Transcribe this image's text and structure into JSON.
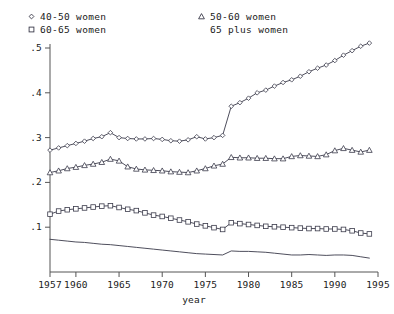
{
  "chart_data": {
    "type": "line",
    "title": "",
    "xlabel": "year",
    "ylabel": "",
    "xlim": [
      1957,
      1995
    ],
    "ylim": [
      0,
      0.53
    ],
    "grid": false,
    "legend_position": "top",
    "xticks": [
      1957,
      1960,
      1965,
      1970,
      1975,
      1980,
      1985,
      1990,
      1995
    ],
    "xtick_labels": [
      "1957",
      "1960",
      "1965",
      "1970",
      "1975",
      "1980",
      "1985",
      "1990",
      "1995"
    ],
    "yticks": [
      0.1,
      0.2,
      0.3,
      0.4,
      0.5
    ],
    "ytick_labels": [
      ".1",
      ".2",
      ".3",
      ".4",
      ".5"
    ],
    "x": [
      1957,
      1958,
      1959,
      1960,
      1961,
      1962,
      1963,
      1964,
      1965,
      1966,
      1967,
      1968,
      1969,
      1970,
      1971,
      1972,
      1973,
      1974,
      1975,
      1976,
      1977,
      1978,
      1979,
      1980,
      1981,
      1982,
      1983,
      1984,
      1985,
      1986,
      1987,
      1988,
      1989,
      1990,
      1991,
      1992,
      1993,
      1994
    ],
    "series": [
      {
        "name": "40-50 women",
        "marker": "diamond",
        "values": [
          0.272,
          0.277,
          0.282,
          0.287,
          0.292,
          0.298,
          0.302,
          0.311,
          0.3,
          0.298,
          0.297,
          0.297,
          0.298,
          0.296,
          0.293,
          0.292,
          0.295,
          0.302,
          0.297,
          0.3,
          0.305,
          0.37,
          0.378,
          0.388,
          0.4,
          0.406,
          0.415,
          0.423,
          0.429,
          0.437,
          0.447,
          0.455,
          0.462,
          0.472,
          0.484,
          0.494,
          0.504,
          0.511
        ]
      },
      {
        "name": "50-60 women",
        "marker": "triangle",
        "values": [
          0.222,
          0.226,
          0.231,
          0.234,
          0.238,
          0.241,
          0.245,
          0.252,
          0.248,
          0.235,
          0.23,
          0.228,
          0.227,
          0.226,
          0.224,
          0.223,
          0.222,
          0.226,
          0.231,
          0.237,
          0.241,
          0.256,
          0.255,
          0.255,
          0.254,
          0.254,
          0.253,
          0.253,
          0.258,
          0.26,
          0.259,
          0.258,
          0.262,
          0.271,
          0.276,
          0.272,
          0.268,
          0.272
        ]
      },
      {
        "name": "60-65 women",
        "marker": "square",
        "values": [
          0.129,
          0.136,
          0.139,
          0.141,
          0.143,
          0.145,
          0.147,
          0.148,
          0.144,
          0.14,
          0.137,
          0.132,
          0.127,
          0.124,
          0.12,
          0.116,
          0.112,
          0.107,
          0.103,
          0.099,
          0.095,
          0.11,
          0.108,
          0.106,
          0.104,
          0.102,
          0.101,
          0.1,
          0.099,
          0.098,
          0.097,
          0.097,
          0.096,
          0.096,
          0.095,
          0.092,
          0.087,
          0.085
        ]
      },
      {
        "name": "65 plus women",
        "marker": "none",
        "values": [
          0.073,
          0.071,
          0.069,
          0.067,
          0.066,
          0.064,
          0.062,
          0.061,
          0.059,
          0.057,
          0.055,
          0.053,
          0.051,
          0.049,
          0.047,
          0.045,
          0.043,
          0.041,
          0.04,
          0.039,
          0.038,
          0.047,
          0.046,
          0.046,
          0.045,
          0.044,
          0.042,
          0.04,
          0.038,
          0.038,
          0.039,
          0.038,
          0.037,
          0.038,
          0.038,
          0.037,
          0.034,
          0.031
        ]
      }
    ]
  },
  "legend": {
    "entries": [
      {
        "label": "40-50 women",
        "marker": "diamond"
      },
      {
        "label": "60-65 women",
        "marker": "square"
      },
      {
        "label": "50-60 women",
        "marker": "triangle"
      },
      {
        "label": "65 plus women",
        "marker": "none"
      }
    ]
  },
  "colors": {
    "line": "#3a3a4a",
    "axis": "#555555",
    "text": "#1a1a1a",
    "background": "#ffffff"
  }
}
